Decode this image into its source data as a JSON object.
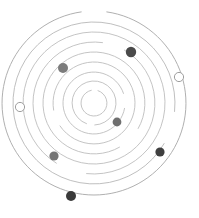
{
  "figure": {
    "background_color": "#ffffff",
    "center": {
      "x": 94,
      "y": 103
    },
    "width": 199,
    "height": 218
  },
  "chart_data": {
    "type": "scatter",
    "subtitle": "",
    "xlabel": "",
    "ylabel": "",
    "grid": false,
    "legend_position": "none",
    "coordinate_system": "polar",
    "center": {
      "x": 94,
      "y": 103
    },
    "orbits": [
      {
        "index": 1,
        "radius": 13,
        "color": "#bdbdbd",
        "stroke_width": 0.9,
        "arc_start_deg": 18,
        "arc_sweep_deg": 330
      },
      {
        "index": 2,
        "radius": 22,
        "color": "#bdbdbd",
        "stroke_width": 0.9,
        "arc_start_deg": 200,
        "arc_sweep_deg": 338
      },
      {
        "index": 3,
        "radius": 31,
        "color": "#bdbdbd",
        "stroke_width": 0.9,
        "arc_start_deg": 100,
        "arc_sweep_deg": 332
      },
      {
        "index": 4,
        "radius": 41,
        "color": "#bdbdbd",
        "stroke_width": 0.9,
        "arc_start_deg": 260,
        "arc_sweep_deg": 336
      },
      {
        "index": 5,
        "radius": 51,
        "color": "#bdbdbd",
        "stroke_width": 0.9,
        "arc_start_deg": 150,
        "arc_sweep_deg": 330
      },
      {
        "index": 6,
        "radius": 61,
        "color": "#bdbdbd",
        "stroke_width": 0.9,
        "arc_start_deg": 30,
        "arc_sweep_deg": 338
      },
      {
        "index": 7,
        "radius": 71,
        "color": "#bdbdbd",
        "stroke_width": 0.9,
        "arc_start_deg": 212,
        "arc_sweep_deg": 334
      },
      {
        "index": 8,
        "radius": 81,
        "color": "#b8b8b8",
        "stroke_width": 0.9,
        "arc_start_deg": 120,
        "arc_sweep_deg": 336
      },
      {
        "index": 9,
        "radius": 92,
        "color": "#b0b0b0",
        "stroke_width": 1.0,
        "arc_start_deg": 8,
        "arc_sweep_deg": 344
      }
    ],
    "bodies": [
      {
        "id": "body-1",
        "label": "",
        "x": 131,
        "y": 52,
        "orbit": 8,
        "radius": 5.2,
        "fill": "#4a4a4a",
        "stroke": "none",
        "style": "filled"
      },
      {
        "id": "body-2",
        "label": "",
        "x": 63,
        "y": 68,
        "orbit": 6,
        "radius": 5.0,
        "fill": "#7c7c7c",
        "stroke": "none",
        "style": "filled"
      },
      {
        "id": "body-3",
        "label": "",
        "x": 179,
        "y": 77,
        "orbit": 9,
        "radius": 4.6,
        "fill": "#ffffff",
        "stroke": "#9e9e9e",
        "style": "open"
      },
      {
        "id": "body-4",
        "label": "",
        "x": 20,
        "y": 107,
        "orbit": 9,
        "radius": 4.6,
        "fill": "#ffffff",
        "stroke": "#9e9e9e",
        "style": "open"
      },
      {
        "id": "body-5",
        "label": "",
        "x": 117,
        "y": 122,
        "orbit": 3,
        "radius": 4.4,
        "fill": "#6f6f6f",
        "stroke": "none",
        "style": "filled"
      },
      {
        "id": "body-6",
        "label": "",
        "x": 54,
        "y": 156,
        "orbit": 6,
        "radius": 4.6,
        "fill": "#757575",
        "stroke": "none",
        "style": "filled"
      },
      {
        "id": "body-7",
        "label": "",
        "x": 160,
        "y": 152,
        "orbit": 8,
        "radius": 4.6,
        "fill": "#3f3f3f",
        "stroke": "none",
        "style": "filled"
      },
      {
        "id": "body-8",
        "label": "",
        "x": 71,
        "y": 196,
        "orbit": 9,
        "radius": 5.0,
        "fill": "#3a3a3a",
        "stroke": "none",
        "style": "filled"
      }
    ],
    "colors": {
      "orbit_line": "#bdbdbd",
      "body_dark": "#3a3a3a",
      "body_mid": "#757575",
      "body_open_stroke": "#9e9e9e",
      "background": "#ffffff"
    }
  }
}
